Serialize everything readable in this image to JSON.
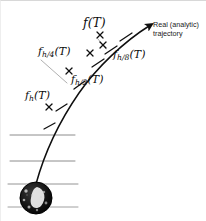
{
  "figure": {
    "kind": "numerical-integration-convergence-diagram",
    "width": 206,
    "height": 221,
    "background_color": "#ffffff",
    "border_color": "#d8d8d8"
  },
  "annotations": {
    "real_trajectory": "Real (analytic)\ntrajectory"
  },
  "labels": {
    "f_T": {
      "base": "f",
      "sub": "",
      "arg": "(T)"
    },
    "f_h_T": {
      "base": "f",
      "sub": "h",
      "arg": "(T)"
    },
    "f_h2_T": {
      "base": "f",
      "sub": "h/2",
      "arg": "(T)"
    },
    "f_h4_T": {
      "base": "f",
      "sub": "h/4",
      "arg": "(T)"
    },
    "f_h8_T": {
      "base": "f",
      "sub": "h/8",
      "arg": "(T)"
    }
  },
  "colors": {
    "curve": "#0f0f0f",
    "ground_line": "#6b6b6b",
    "ball_fill": "#121212",
    "ball_highlight": "#f2f2f2",
    "text": "#111111"
  },
  "geometry": {
    "trajectory_path": "M 35 183 C 44 150, 60 118, 78 92 C 96 66, 124 40, 149 24",
    "arrow_tip": {
      "x": 151,
      "y": 21
    },
    "ball": {
      "cx": 35,
      "cy": 197,
      "r": 16
    },
    "ground_lines": [
      {
        "y": 134,
        "x1": 9,
        "x2": 74
      },
      {
        "y": 160,
        "x1": 9,
        "x2": 74
      },
      {
        "y": 183,
        "x1": 7,
        "x2": 77
      },
      {
        "y": 206,
        "x1": 7,
        "x2": 77
      }
    ],
    "tick_marks": [
      {
        "x": 48,
        "y": 123,
        "angle": -62
      },
      {
        "x": 60,
        "y": 104,
        "angle": -58
      },
      {
        "x": 78,
        "y": 82,
        "angle": -50
      },
      {
        "x": 96,
        "y": 60,
        "angle": -42
      },
      {
        "x": 109,
        "y": 46,
        "angle": -36
      },
      {
        "x": 124,
        "y": 35,
        "angle": -30
      }
    ],
    "cross_markers": [
      {
        "x": 48,
        "y": 106,
        "label": "f_h_T"
      },
      {
        "x": 68,
        "y": 70,
        "label": "f_h2_T"
      },
      {
        "x": 89,
        "y": 52,
        "label": "f_h4_T"
      },
      {
        "x": 105,
        "y": 47,
        "label": "f_h8_T"
      },
      {
        "x": 98,
        "y": 34,
        "label": "f_T"
      }
    ],
    "leader_lines": [
      {
        "x1": 44,
        "y1": 60,
        "x2": 66,
        "y2": 80
      },
      {
        "x1": 96,
        "y1": 40,
        "x2": 104,
        "y2": 48
      }
    ]
  }
}
